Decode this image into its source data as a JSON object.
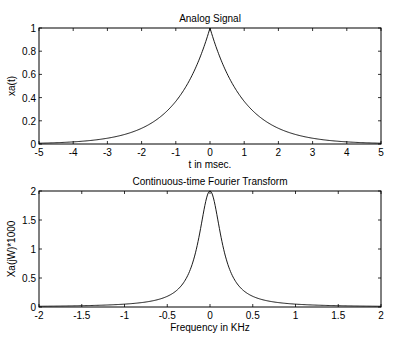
{
  "chart_data": [
    {
      "type": "line",
      "title": "Analog Signal",
      "xlabel": "t in msec.",
      "ylabel": "xa(t)",
      "xlim": [
        -5,
        5
      ],
      "ylim": [
        0,
        1
      ],
      "xticks": [
        -5,
        -4,
        -3,
        -2,
        -1,
        0,
        1,
        2,
        3,
        4,
        5
      ],
      "yticks": [
        0,
        0.2,
        0.4,
        0.6,
        0.8,
        1
      ],
      "grid": false,
      "series": [
        {
          "name": "xa(t)",
          "x": [
            -5,
            -4,
            -3,
            -2,
            -1.5,
            -1,
            -0.5,
            -0.25,
            0,
            0.25,
            0.5,
            1,
            1.5,
            2,
            3,
            4,
            5
          ],
          "values": [
            0.0067,
            0.018,
            0.05,
            0.135,
            0.223,
            0.368,
            0.607,
            0.779,
            1.0,
            0.779,
            0.607,
            0.368,
            0.223,
            0.135,
            0.05,
            0.018,
            0.0067
          ]
        }
      ]
    },
    {
      "type": "line",
      "title": "Continuous-time Fourier Transform",
      "xlabel": "Frequency in KHz",
      "ylabel": "Xa(jW)*1000",
      "xlim": [
        -2,
        2
      ],
      "ylim": [
        0,
        2
      ],
      "xticks": [
        -2,
        -1.5,
        -1,
        -0.5,
        0,
        0.5,
        1,
        1.5,
        2
      ],
      "yticks": [
        0,
        0.5,
        1,
        1.5,
        2
      ],
      "grid": false,
      "series": [
        {
          "name": "Xa(jW)*1000",
          "x": [
            -2,
            -1.5,
            -1,
            -0.5,
            -0.3,
            -0.2,
            -0.1,
            0,
            0.1,
            0.2,
            0.3,
            0.5,
            1,
            1.5,
            2
          ],
          "values": [
            0.0125,
            0.022,
            0.049,
            0.184,
            0.439,
            0.775,
            1.434,
            2.0,
            1.434,
            0.775,
            0.439,
            0.184,
            0.049,
            0.022,
            0.0125
          ]
        }
      ]
    }
  ]
}
